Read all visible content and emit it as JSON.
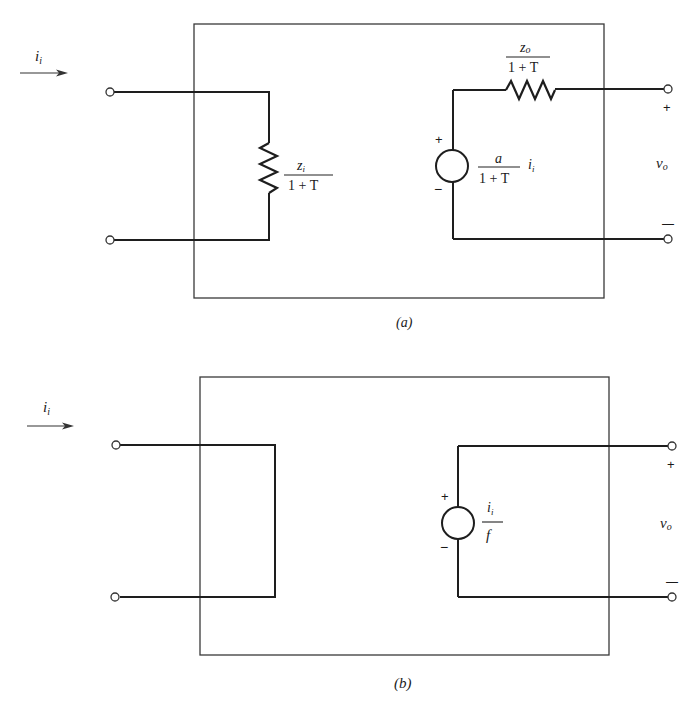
{
  "figure": {
    "panels": [
      {
        "id": "a",
        "caption": "(a)",
        "input_current": {
          "symbol": "i",
          "subscript": "i"
        },
        "input_resistor": {
          "numerator": "z",
          "num_sub": "i",
          "denominator": "1 + T"
        },
        "output_resistor": {
          "numerator": "z",
          "num_sub": "o",
          "denominator": "1 + T"
        },
        "source": {
          "plus": "+",
          "minus": "−",
          "numerator": "a",
          "denominator": "1 + T",
          "multiplier": "i",
          "multiplier_sub": "i"
        },
        "output_voltage": {
          "symbol": "v",
          "subscript": "o",
          "plus": "+",
          "minus": "—"
        }
      },
      {
        "id": "b",
        "caption": "(b)",
        "input_current": {
          "symbol": "i",
          "subscript": "i"
        },
        "source": {
          "plus": "+",
          "minus": "−",
          "numerator": "i",
          "num_sub": "i",
          "denominator": "f"
        },
        "output_voltage": {
          "symbol": "v",
          "subscript": "o",
          "plus": "+",
          "minus": "—"
        }
      }
    ]
  }
}
